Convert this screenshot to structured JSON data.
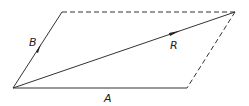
{
  "diagram": {
    "labels": {
      "A": "A",
      "B": "B",
      "R": "R"
    },
    "colors": {
      "line": "#333333",
      "background": "#ffffff"
    },
    "points": {
      "origin": [
        13,
        88
      ],
      "B_tip": [
        62,
        12
      ],
      "A_tip": [
        187,
        88
      ],
      "R_tip": [
        235,
        12
      ]
    },
    "edges": [
      {
        "name": "vector-A",
        "style": "solid"
      },
      {
        "name": "vector-B",
        "style": "solid",
        "arrow": true
      },
      {
        "name": "vector-R",
        "style": "solid",
        "arrow": true
      },
      {
        "name": "top-edge",
        "style": "dashed"
      },
      {
        "name": "right-edge",
        "style": "dashed"
      }
    ]
  }
}
